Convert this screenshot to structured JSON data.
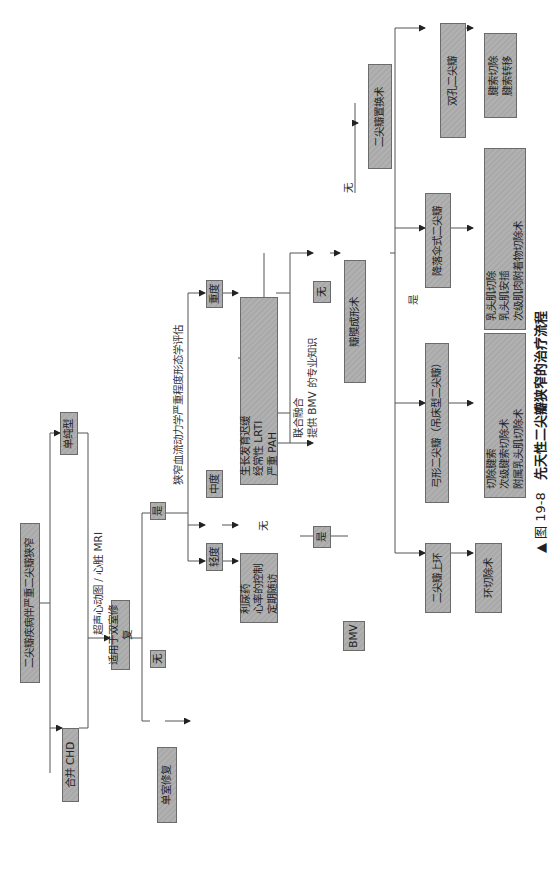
{
  "figure": {
    "caption_prefix": "▲ 图 19-8",
    "caption_title": "先天性二尖瓣狭窄的治疗流程",
    "rotation": "rotated 90° counter-clockwise on page"
  },
  "nodes": {
    "root": "二尖瓣疾病伴严重二尖瓣狭窄",
    "simple": "单纯型",
    "chd": "合并 CHD",
    "biventricular": "适用于双室修复",
    "no_univentricular": "无",
    "univentricular": "单室修复",
    "yes_biv": "是",
    "mild": "轻度",
    "moderate": "中度",
    "severe": "重度",
    "medical": "利尿药\n心率的控制\n定期随访",
    "risk": "生长发育迟缓\n经常性 LRTI\n严重 PAH",
    "yes_bmv": "是",
    "bmv": "BMV",
    "no_bmv": "无",
    "valvuloplasty": "瓣膜成形术",
    "mvr": "二尖瓣置换术",
    "supravalvular_ring": "二尖瓣上环",
    "arcade": "弓形二尖瓣（吊床型二尖瓣）",
    "parachute": "降落伞式二尖瓣",
    "double_orifice": "双孔二尖瓣",
    "ring_resection": "环切除术",
    "arcade_surgery": "切除腱索\n次级腱索切除术\n附属乳头肌切除术",
    "parachute_surgery": "乳头肌切除\n乳头肌安插\n次级肌肉附着物切除术",
    "double_orifice_surgery": "腱索切除\n腱索转移"
  },
  "edge_labels": {
    "imaging": "超声心动图 / 心脏 MRI",
    "severity_eval": "狭窄血流动力学严重程度形态学评估",
    "no_from_risk": "无",
    "consensus": "联合融合\n提供 BMV 的专业知识",
    "no_to_mvr": "无",
    "yes_to_types": "是"
  },
  "colors": {
    "box_fill": "#adadad",
    "box_border": "#6b6b6b",
    "line": "#555555",
    "text": "#222222"
  }
}
